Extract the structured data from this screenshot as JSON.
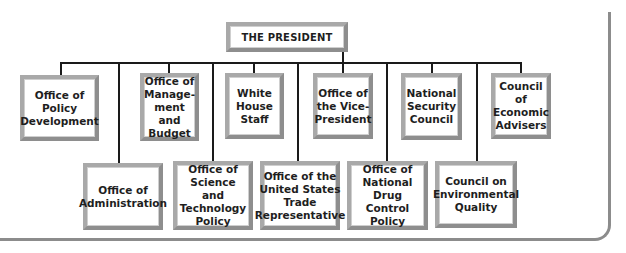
{
  "title": "THE PRESIDENT",
  "top_row": [
    {
      "label": "Office of\nPolicy\nDevelopment"
    },
    {
      "label": "Office of\nManage-\nment and\nBudget"
    },
    {
      "label": "White\nHouse\nStaff"
    },
    {
      "label": "Office of\nthe Vice-\nPresident"
    },
    {
      "label": "National\nSecurity\nCouncil"
    },
    {
      "label": "Council of\nEconomic\nAdvisers"
    }
  ],
  "bottom_row": [
    {
      "label": "Office of\nAdministration"
    },
    {
      "label": "Office of\nScience and\nTechnology\nPolicy"
    },
    {
      "label": "Office of the\nUnited States\nTrade\nRepresentative"
    },
    {
      "label": "Office of\nNational\nDrug Control\nPolicy"
    },
    {
      "label": "Council on\nEnvironmental\nQuality"
    }
  ],
  "colors": {
    "line": "#1a1a1a",
    "box_border": "#a9a9a9",
    "frame": "#8c8c8c"
  }
}
